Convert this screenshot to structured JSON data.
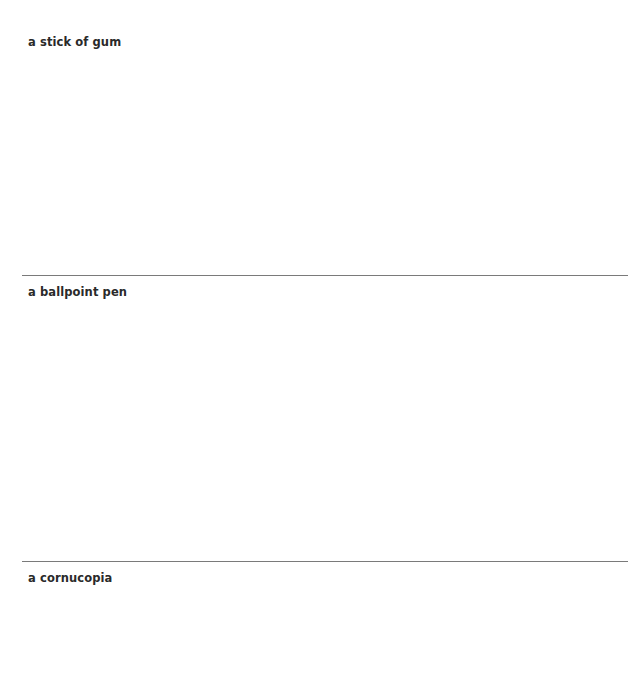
{
  "sections": [
    {
      "label": "a stick of gum",
      "has_top_divider": false
    },
    {
      "label": "a ballpoint pen",
      "has_top_divider": true
    },
    {
      "label": "a cornucopia",
      "has_top_divider": true
    }
  ],
  "colors": {
    "background": "#ffffff",
    "text": "#2a2a2a",
    "divider": "#7a7a7a"
  }
}
